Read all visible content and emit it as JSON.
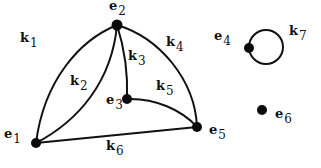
{
  "diagram": {
    "type": "graph",
    "vertices": [
      {
        "id": "e1",
        "base": "e",
        "sub": "1",
        "x": 36,
        "y": 143,
        "lx": 4,
        "ly": 138
      },
      {
        "id": "e2",
        "base": "e",
        "sub": "2",
        "x": 117,
        "y": 25,
        "lx": 109,
        "ly": 10
      },
      {
        "id": "e3",
        "base": "e",
        "sub": "3",
        "x": 127,
        "y": 99,
        "lx": 106,
        "ly": 106
      },
      {
        "id": "e4",
        "base": "e",
        "sub": "4",
        "x": 249,
        "y": 48,
        "lx": 214,
        "ly": 40
      },
      {
        "id": "e5",
        "base": "e",
        "sub": "5",
        "x": 197,
        "y": 127,
        "lx": 209,
        "ly": 134
      },
      {
        "id": "e6",
        "base": "e",
        "sub": "6",
        "x": 262,
        "y": 110,
        "lx": 275,
        "ly": 118
      }
    ],
    "edges": [
      {
        "id": "k1",
        "base": "k",
        "sub": "1",
        "from": "e1",
        "to": "e2",
        "lx": 20,
        "ly": 42
      },
      {
        "id": "k2",
        "base": "k",
        "sub": "2",
        "from": "e1",
        "to": "e2",
        "lx": 70,
        "ly": 85
      },
      {
        "id": "k3",
        "base": "k",
        "sub": "3",
        "from": "e2",
        "to": "e3",
        "lx": 128,
        "ly": 57
      },
      {
        "id": "k4",
        "base": "k",
        "sub": "4",
        "from": "e2",
        "to": "e5",
        "lx": 166,
        "ly": 43
      },
      {
        "id": "k5",
        "base": "k",
        "sub": "5",
        "from": "e3",
        "to": "e5",
        "lx": 156,
        "ly": 87
      },
      {
        "id": "k6",
        "base": "k",
        "sub": "6",
        "from": "e1",
        "to": "e5",
        "lx": 106,
        "ly": 150
      },
      {
        "id": "k7",
        "base": "k",
        "sub": "7",
        "from": "e4",
        "to": "e4",
        "lx": 289,
        "ly": 33
      }
    ]
  }
}
